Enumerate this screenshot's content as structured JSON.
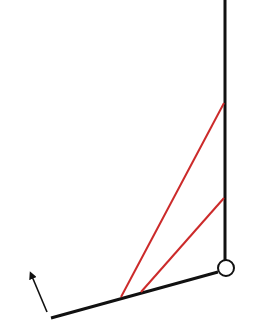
{
  "diagram": {
    "colors": {
      "background": "#ffffff",
      "structure": "#111111",
      "cable": "#cc2a2a",
      "joint_fill": "#ffffff"
    },
    "post": {
      "x1": 225,
      "y1": 0,
      "x2": 225,
      "y2": 260
    },
    "joint": {
      "cx": 226,
      "cy": 268,
      "r": 8
    },
    "beam": {
      "x1": 51,
      "y1": 318,
      "x2": 218,
      "y2": 272
    },
    "cables": [
      {
        "x1": 224,
        "y1": 103,
        "x2": 121,
        "y2": 297
      },
      {
        "x1": 224,
        "y1": 198,
        "x2": 141,
        "y2": 292
      }
    ],
    "arrow": {
      "x1": 47,
      "y1": 312,
      "x2": 31,
      "y2": 274
    }
  }
}
